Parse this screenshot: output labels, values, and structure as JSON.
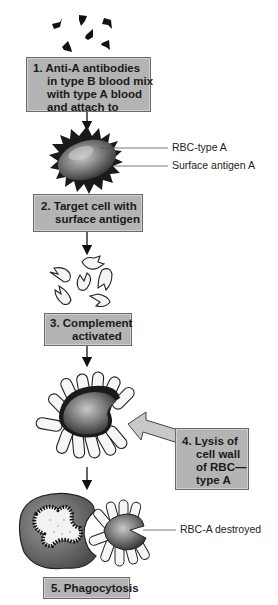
{
  "steps": [
    {
      "number": "1.",
      "lines": [
        "Anti-A antibodies",
        "in type B blood mix",
        "with type A blood",
        "and attach to"
      ]
    },
    {
      "number": "2.",
      "lines": [
        "Target cell with",
        "surface antigen"
      ]
    },
    {
      "number": "3.",
      "lines": [
        "Complement",
        "activated"
      ]
    },
    {
      "number": "4.",
      "lines": [
        "Lysis of",
        "cell wall",
        "of RBC—",
        "type A"
      ]
    },
    {
      "number": "5.",
      "lines": [
        "Phagocytosis"
      ]
    }
  ],
  "labels": {
    "rbc_type_a": "RBC-type A",
    "surface_antigen_a": "Surface antigen A",
    "rbc_a_destroyed": "RBC-A destroyed"
  },
  "colors": {
    "box_fill": "#b4b4b4",
    "box_border": "#6a6a6a",
    "cell_fill": "#7a7a7a",
    "ink": "#111111"
  }
}
